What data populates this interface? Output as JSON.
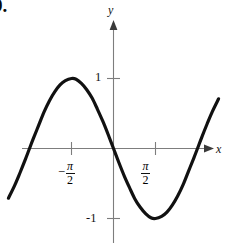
{
  "figure": {
    "problem_number": "9.",
    "axis_labels": {
      "x": "x",
      "y": "y"
    },
    "y_ticks": [
      {
        "name": "positive-one",
        "label": "1"
      },
      {
        "name": "negative-one",
        "label": "-1"
      }
    ],
    "x_ticks": [
      {
        "name": "negative-pi-over-two",
        "minus": "−",
        "numerator": "π",
        "denominator": "2"
      },
      {
        "name": "pi-over-two",
        "minus": "",
        "numerator": "π",
        "denominator": "2"
      }
    ],
    "colors": {
      "curve": "#111111",
      "axis": "#7d7d7d",
      "arrow": "#3a3a3a",
      "text": "#111111",
      "background": "#ffffff"
    }
  },
  "chart_data": {
    "type": "line",
    "title": "",
    "xlabel": "x",
    "ylabel": "y",
    "function": "y = -sin(x)",
    "xlim": [
      -3.93,
      3.93
    ],
    "ylim": [
      -1.45,
      1.55
    ],
    "xticks": [
      -1.5708,
      1.5708
    ],
    "xticklabels": [
      "-π/2",
      "π/2"
    ],
    "yticks": [
      -1,
      1
    ],
    "yticklabels": [
      "1",
      "-1"
    ],
    "grid": false,
    "legend": false,
    "x": [
      -3.93,
      -3.7,
      -3.5,
      -3.3,
      -3.1416,
      -3.0,
      -2.8,
      -2.6,
      -2.4,
      -2.2,
      -2.0,
      -1.8,
      -1.5708,
      -1.4,
      -1.2,
      -1.0,
      -0.8,
      -0.6,
      -0.4,
      -0.2,
      0.0,
      0.2,
      0.4,
      0.6,
      0.8,
      1.0,
      1.2,
      1.4,
      1.5708,
      1.8,
      2.0,
      2.2,
      2.4,
      2.6,
      2.8,
      3.0,
      3.1416,
      3.3,
      3.5,
      3.7,
      3.93
    ],
    "y": [
      -0.71,
      -0.53,
      -0.35,
      -0.16,
      0.0,
      0.14,
      0.33,
      0.52,
      0.68,
      0.81,
      0.91,
      0.97,
      1.0,
      0.99,
      0.93,
      0.84,
      0.72,
      0.56,
      0.39,
      0.2,
      0.0,
      -0.2,
      -0.39,
      -0.56,
      -0.72,
      -0.84,
      -0.93,
      -0.99,
      -1.0,
      -0.97,
      -0.91,
      -0.81,
      -0.68,
      -0.52,
      -0.33,
      -0.14,
      0.0,
      0.16,
      0.35,
      0.53,
      0.71
    ],
    "annotations": [
      {
        "name": "maximum",
        "x": -1.5708,
        "y": 1,
        "text": ""
      },
      {
        "name": "minimum",
        "x": 1.5708,
        "y": -1,
        "text": ""
      },
      {
        "name": "origin-crossing",
        "x": 0,
        "y": 0,
        "text": ""
      }
    ]
  }
}
